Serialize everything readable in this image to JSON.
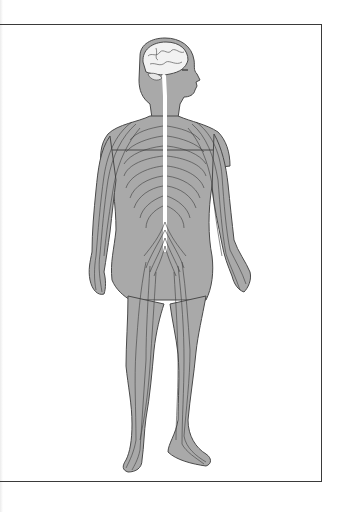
{
  "diagram": {
    "view": "full body, anterior, head turned right in profile",
    "components": [
      {
        "name": "brain",
        "label": "Brain"
      },
      {
        "name": "spinal-cord",
        "label": "Spinal cord"
      },
      {
        "name": "intercostal-nerves",
        "label": "Intercostal nerves"
      },
      {
        "name": "lumbosacral-plexus",
        "label": "Lumbosacral plexus"
      },
      {
        "name": "arm-nerves",
        "label": "Nerves of the arms"
      },
      {
        "name": "leg-nerves",
        "label": "Nerves of the legs"
      }
    ],
    "colors": {
      "body_fill": "#a9a9a9",
      "outline": "#4a4a4a",
      "nerve": "#3c3c3c",
      "brain_fill": "#f2f2f2",
      "spinal_cord": "#ffffff",
      "frame": "#3a3a3a",
      "background": "#ffffff"
    }
  }
}
